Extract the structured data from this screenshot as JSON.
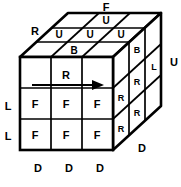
{
  "diagram": {
    "type": "rubiks-cube-notation",
    "stroke_color": "#000000",
    "fill_color": "#ffffff",
    "line_width_outer": 2.6,
    "line_width_inner": 1.6,
    "geometry": {
      "front_top_left": [
        20,
        57
      ],
      "front_top_right": [
        113,
        57
      ],
      "front_bottom_left": [
        20,
        150
      ],
      "front_bottom_right": [
        113,
        150
      ],
      "depth_offset": [
        48,
        -44
      ],
      "grid": 3
    },
    "faces": {
      "front": {
        "name": "front-face",
        "rows": [
          [
            "",
            "",
            ""
          ],
          [
            "F",
            "F",
            "F"
          ],
          [
            "F",
            "F",
            "F"
          ]
        ]
      },
      "top": {
        "name": "top-face",
        "rows": [
          [
            "",
            "U",
            ""
          ],
          [
            "U",
            "U",
            "U"
          ],
          [
            "",
            "B",
            ""
          ]
        ]
      },
      "right": {
        "name": "right-face",
        "rows": [
          [
            "",
            "B",
            ""
          ],
          [
            "",
            "R",
            "L"
          ],
          [
            "R",
            "R",
            ""
          ]
        ]
      }
    },
    "outer_labels": [
      {
        "name": "label-F-top",
        "text": "F",
        "x": 106,
        "y": 7
      },
      {
        "name": "label-R-topleft",
        "text": "R",
        "x": 35,
        "y": 31
      },
      {
        "name": "label-U-right",
        "text": "U",
        "x": 174,
        "y": 62
      },
      {
        "name": "label-L-upper",
        "text": "L",
        "x": 8,
        "y": 106
      },
      {
        "name": "label-L-lower",
        "text": "L",
        "x": 8,
        "y": 136
      },
      {
        "name": "label-D-1",
        "text": "D",
        "x": 38,
        "y": 168
      },
      {
        "name": "label-D-2",
        "text": "D",
        "x": 69,
        "y": 168
      },
      {
        "name": "label-D-3",
        "text": "D",
        "x": 100,
        "y": 168
      },
      {
        "name": "label-D-right",
        "text": "D",
        "x": 142,
        "y": 148
      }
    ],
    "move_annotation": {
      "name": "r-move-arrow",
      "label": "R",
      "label_x": 66,
      "label_y": 75,
      "arrow_start_x": 32,
      "arrow_end_x": 104,
      "arrow_y": 85
    }
  }
}
